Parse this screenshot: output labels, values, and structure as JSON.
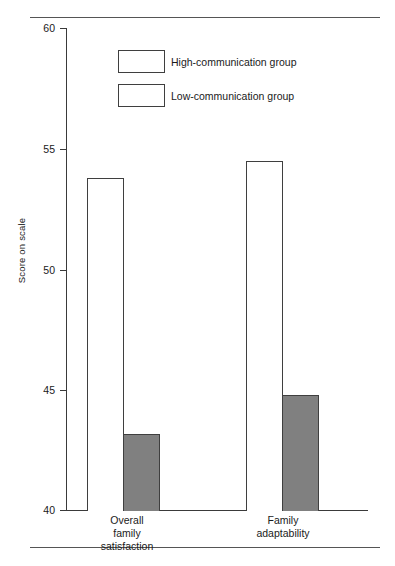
{
  "chart_data": {
    "type": "bar",
    "title": "",
    "xlabel": "",
    "ylabel": "Score on scale",
    "ylim": [
      40,
      60
    ],
    "yticks": [
      40,
      45,
      50,
      55,
      60
    ],
    "ytick_labels": [
      "40",
      "45",
      "50",
      "55",
      "60"
    ],
    "grid": false,
    "legend_position": "upper-left-inside",
    "categories": [
      "Overall family satisfaction",
      "Family adaptability"
    ],
    "category_lines": [
      [
        "Overall",
        "family",
        "satisfaction"
      ],
      [
        "Family",
        "adaptability"
      ]
    ],
    "series": [
      {
        "name": "High-communication group",
        "swatch": "open",
        "fill": "#ffffff",
        "edge": "#3f3f3f",
        "values": [
          53.8,
          54.5
        ]
      },
      {
        "name": "Low-communication group",
        "swatch": "open",
        "fill": "#808080",
        "edge": "#3f3f3f",
        "values": [
          43.2,
          44.8
        ]
      }
    ]
  },
  "axis": {
    "y_title": "Score on scale",
    "ticks": [
      {
        "label": "60",
        "value": 60
      },
      {
        "label": "55",
        "value": 55
      },
      {
        "label": "50",
        "value": 50
      },
      {
        "label": "45",
        "value": 45
      },
      {
        "label": "40",
        "value": 40
      }
    ]
  },
  "legend": {
    "items": [
      {
        "label": "High-communication group"
      },
      {
        "label": "Low-communication group"
      }
    ]
  },
  "categories": [
    {
      "line1": "Overall",
      "line2": "family",
      "line3": "satisfaction"
    },
    {
      "line1": "Family",
      "line2": "adaptability",
      "line3": ""
    }
  ],
  "colors": {
    "bar_open_fill": "#ffffff",
    "bar_filled_fill": "#808080",
    "bar_edge": "#3f3f3f",
    "axis": "#3a3a3a",
    "rule": "#555555",
    "text": "#1a1a1a"
  }
}
